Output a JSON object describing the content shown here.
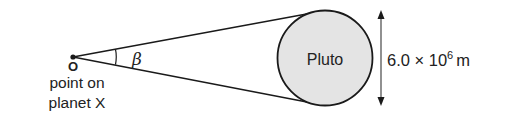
{
  "diagram": {
    "observer": {
      "point_label": "O",
      "caption_line1": "point on",
      "caption_line2": "planet X"
    },
    "angle": {
      "symbol": "β"
    },
    "planet": {
      "name": "Pluto",
      "fill_color": "#e4e4e4"
    },
    "dimension": {
      "value": "6.0 × 10",
      "exponent": "6",
      "unit": "m"
    },
    "colors": {
      "line": "#1a1a1a",
      "text": "#222222",
      "dimension_line": "#555555"
    }
  }
}
